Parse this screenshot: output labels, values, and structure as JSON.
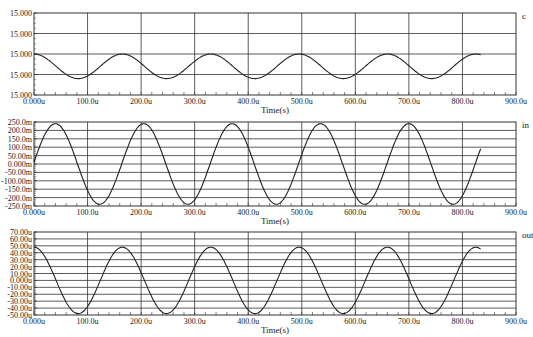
{
  "chart_data": [
    {
      "type": "line",
      "signal": "c",
      "xlabel": "Time(s)",
      "x_ticks": [
        "0.000u",
        "100.0u",
        "200.0u",
        "300.0u",
        "400.0u",
        "500.0u",
        "600.0u",
        "700.0u",
        "800.0u",
        "900.0u"
      ],
      "y_ticks": [
        "15.000",
        "15.000",
        "15.000",
        "15.000",
        "15.000"
      ],
      "xlim": [
        0,
        900
      ],
      "ylim": [
        -1,
        1
      ],
      "grid": true,
      "period_us": 165,
      "phase_peak_us": 165,
      "amplitude_norm": 0.3,
      "offset_norm": -0.3,
      "x_end_us": 835
    },
    {
      "type": "line",
      "signal": "in",
      "xlabel": "Time(s)",
      "x_ticks": [
        "0.000u",
        "100.0u",
        "200.0u",
        "300.0u",
        "400.0u",
        "500.0u",
        "600.0u",
        "700.0u",
        "800.0u",
        "900.0u"
      ],
      "y_ticks": [
        "250.0m",
        "200.0m",
        "150.0m",
        "100.0m",
        "50.00m",
        "0.000m",
        "-50.00m",
        "-100.00m",
        "-150.0m",
        "-200.0m",
        "-250.0m"
      ],
      "xlim": [
        0,
        900
      ],
      "ylim": [
        -250,
        250
      ],
      "grid": true,
      "amplitude": 240,
      "period_us": 165,
      "x_end_us": 835,
      "peaks_us": [
        40,
        205,
        375,
        540,
        705
      ],
      "troughs_us": [
        125,
        290,
        455,
        620,
        790
      ]
    },
    {
      "type": "line",
      "signal": "out",
      "xlabel": "Time(s)",
      "x_ticks": [
        "0.000u",
        "100.0u",
        "200.0u",
        "300.0u",
        "400.0u",
        "500.0u",
        "600.0u",
        "700.0u",
        "800.0u",
        "900.0u"
      ],
      "y_ticks": [
        "70.00u",
        "60.00u",
        "50.00u",
        "40.00u",
        "30.00u",
        "20.00u",
        "10.00u",
        "0.000u",
        "-10.00u",
        "-20.00u",
        "-30.00u",
        "-40.00u",
        "-50.00u"
      ],
      "xlim": [
        0,
        900
      ],
      "ylim": [
        -50,
        70
      ],
      "grid": true,
      "amplitude": 48,
      "period_us": 165,
      "x_end_us": 835,
      "peaks_us": [
        0,
        163,
        330,
        495,
        660,
        825
      ],
      "troughs_us": [
        80,
        245,
        410,
        575,
        740
      ]
    }
  ]
}
